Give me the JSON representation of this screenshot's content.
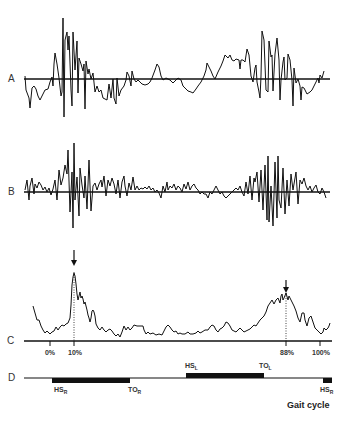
{
  "figure": {
    "panels": [
      {
        "id": "A",
        "label": "A",
        "description": "raw signal trace with horizontal baseline"
      },
      {
        "id": "B",
        "label": "B",
        "description": "high-frequency oscillating signal with horizontal baseline"
      },
      {
        "id": "C",
        "label": "C",
        "description": "smoothed envelope with two arrow-marked peaks"
      },
      {
        "id": "D",
        "label": "D",
        "description": "gait event timeline bars"
      }
    ],
    "axis_ticks": [
      {
        "label": "0%",
        "x": 50
      },
      {
        "label": "10%",
        "x": 74
      },
      {
        "label": "88%",
        "x": 286
      },
      {
        "label": "100%",
        "x": 320
      }
    ],
    "events": [
      {
        "main": "HS",
        "sub": "R",
        "position": "below",
        "x": 54
      },
      {
        "main": "TO",
        "sub": "R",
        "position": "below",
        "x": 128
      },
      {
        "main": "HS",
        "sub": "L",
        "position": "above",
        "x": 185
      },
      {
        "main": "TO",
        "sub": "L",
        "position": "above",
        "x": 259
      },
      {
        "main": "HS",
        "sub": "R",
        "position": "below",
        "x": 320
      }
    ],
    "peak_markers": [
      {
        "name": "peak-10-percent",
        "x": 74
      },
      {
        "name": "peak-88-percent",
        "x": 286
      }
    ],
    "caption": "Gait cycle",
    "colors": {
      "line": "#111111",
      "text": "#333333",
      "background": "#ffffff"
    }
  }
}
